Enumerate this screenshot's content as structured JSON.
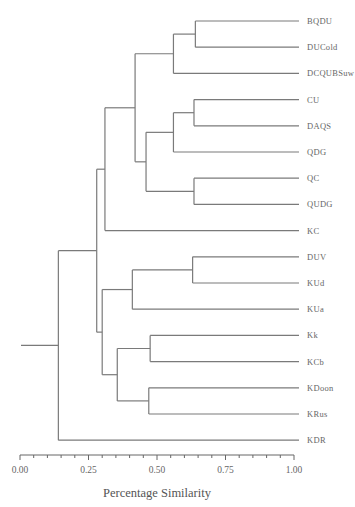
{
  "chart_data": {
    "type": "dendrogram",
    "title": "",
    "xlabel": "Percentage Similarity",
    "ylabel": "",
    "xlim": [
      0.0,
      1.0
    ],
    "x_ticks": [
      "0.00",
      "0.25",
      "0.50",
      "0.75",
      "1.00"
    ],
    "minor_tick_step": 0.05,
    "grid": false,
    "legend": null,
    "leaves": [
      "BQDU",
      "DUCold",
      "DCQUBSuw",
      "CU",
      "DAQS",
      "QDG",
      "QC",
      "QUDG",
      "KC",
      "DUV",
      "KUd",
      "KUa",
      "Kk",
      "KCb",
      "KDoon",
      "KRus",
      "KDR"
    ],
    "merges": [
      {
        "id": "m1",
        "children": [
          "BQDU",
          "DUCold"
        ],
        "similarity": 0.64
      },
      {
        "id": "m2",
        "children": [
          "m1",
          "DCQUBSuw"
        ],
        "similarity": 0.56
      },
      {
        "id": "m3",
        "children": [
          "CU",
          "DAQS"
        ],
        "similarity": 0.635
      },
      {
        "id": "m4",
        "children": [
          "m3",
          "QDG"
        ],
        "similarity": 0.56
      },
      {
        "id": "m5",
        "children": [
          "QC",
          "QUDG"
        ],
        "similarity": 0.635
      },
      {
        "id": "m6",
        "children": [
          "m4",
          "m5"
        ],
        "similarity": 0.46
      },
      {
        "id": "m7",
        "children": [
          "m2",
          "m6"
        ],
        "similarity": 0.42
      },
      {
        "id": "m8",
        "children": [
          "m7",
          "KC"
        ],
        "similarity": 0.31
      },
      {
        "id": "m9",
        "children": [
          "DUV",
          "KUd"
        ],
        "similarity": 0.63
      },
      {
        "id": "m10",
        "children": [
          "m9",
          "KUa"
        ],
        "similarity": 0.41
      },
      {
        "id": "m11",
        "children": [
          "Kk",
          "KCb"
        ],
        "similarity": 0.475
      },
      {
        "id": "m12",
        "children": [
          "KDoon",
          "KRus"
        ],
        "similarity": 0.47
      },
      {
        "id": "m13",
        "children": [
          "m11",
          "m12"
        ],
        "similarity": 0.355
      },
      {
        "id": "m14",
        "children": [
          "m10",
          "m13"
        ],
        "similarity": 0.3
      },
      {
        "id": "m15",
        "children": [
          "m8",
          "m14"
        ],
        "similarity": 0.28
      },
      {
        "id": "m16",
        "children": [
          "m15",
          "KDR"
        ],
        "similarity": 0.14
      }
    ],
    "root_stub_similarity": 0.0
  },
  "colors": {
    "branch": "#7a7a7a",
    "text": "#666666",
    "background": "#ffffff"
  }
}
